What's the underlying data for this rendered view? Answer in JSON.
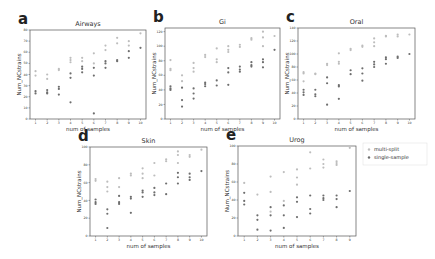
{
  "figure": {
    "legend": {
      "entries": [
        {
          "label": "multi-split",
          "color": "#bdbdbd"
        },
        {
          "label": "single-sample",
          "color": "#6e6e6e"
        }
      ]
    }
  },
  "chart_data": [
    {
      "letter": "a",
      "type": "scatter",
      "title": "Airways",
      "xlabel": "num of samples",
      "ylabel": "Num_NCstrains",
      "ylim": [
        0,
        80
      ],
      "yticks": [
        0,
        10,
        20,
        30,
        40,
        50,
        60,
        70,
        80
      ],
      "xticks": [
        1,
        2,
        3,
        4,
        5,
        6,
        7,
        8,
        9,
        10
      ],
      "frame": [
        30,
        30,
        146,
        119
      ],
      "series": [
        {
          "name": "multi-split",
          "points": [
            [
              1,
              43
            ],
            [
              1,
              39
            ],
            [
              2,
              40
            ],
            [
              2,
              36
            ],
            [
              3,
              45
            ],
            [
              3,
              44
            ],
            [
              4,
              55
            ],
            [
              4,
              53
            ],
            [
              4,
              51
            ],
            [
              5,
              55
            ],
            [
              5,
              52
            ],
            [
              6,
              59
            ],
            [
              6,
              50
            ],
            [
              7,
              66
            ],
            [
              7,
              62
            ],
            [
              8,
              73
            ],
            [
              8,
              68
            ],
            [
              9,
              70
            ],
            [
              9,
              66
            ],
            [
              10,
              77
            ]
          ]
        },
        {
          "name": "single-sample",
          "points": [
            [
              1,
              25
            ],
            [
              1,
              23
            ],
            [
              2,
              26
            ],
            [
              2,
              24
            ],
            [
              2,
              23
            ],
            [
              3,
              29
            ],
            [
              3,
              27
            ],
            [
              3,
              22
            ],
            [
              4,
              41
            ],
            [
              4,
              37
            ],
            [
              4,
              15
            ],
            [
              5,
              47
            ],
            [
              5,
              45
            ],
            [
              5,
              42
            ],
            [
              6,
              46
            ],
            [
              6,
              39
            ],
            [
              6,
              5
            ],
            [
              7,
              52
            ],
            [
              7,
              50
            ],
            [
              7,
              46
            ],
            [
              8,
              53
            ],
            [
              8,
              52
            ],
            [
              9,
              61
            ],
            [
              9,
              55
            ],
            [
              10,
              64
            ]
          ]
        }
      ]
    },
    {
      "letter": "b",
      "type": "scatter",
      "title": "Gi",
      "xlabel": "num of samples",
      "ylabel": "Num_NCstrains",
      "ylim": [
        0,
        125
      ],
      "yticks": [
        0,
        20,
        40,
        60,
        80,
        100,
        120
      ],
      "xticks": [
        1,
        2,
        3,
        4,
        5,
        6,
        7,
        8,
        9,
        10
      ],
      "frame": [
        165,
        28,
        280,
        119
      ],
      "series": [
        {
          "name": "multi-split",
          "points": [
            [
              1,
              81
            ],
            [
              1,
              69
            ],
            [
              1,
              67
            ],
            [
              2,
              60
            ],
            [
              2,
              52
            ],
            [
              3,
              77
            ],
            [
              3,
              70
            ],
            [
              3,
              65
            ],
            [
              4,
              88
            ],
            [
              4,
              85
            ],
            [
              5,
              97
            ],
            [
              5,
              82
            ],
            [
              5,
              78
            ],
            [
              6,
              100
            ],
            [
              6,
              95
            ],
            [
              6,
              92
            ],
            [
              7,
              102
            ],
            [
              7,
              99
            ],
            [
              8,
              111
            ],
            [
              8,
              109
            ],
            [
              9,
              120
            ],
            [
              9,
              112
            ],
            [
              9,
              100
            ],
            [
              10,
              114
            ]
          ]
        },
        {
          "name": "single-sample",
          "points": [
            [
              1,
              45
            ],
            [
              1,
              42
            ],
            [
              1,
              40
            ],
            [
              2,
              43
            ],
            [
              2,
              26
            ],
            [
              2,
              17
            ],
            [
              3,
              42
            ],
            [
              3,
              35
            ],
            [
              3,
              28
            ],
            [
              4,
              50
            ],
            [
              4,
              48
            ],
            [
              4,
              45
            ],
            [
              5,
              53
            ],
            [
              5,
              46
            ],
            [
              6,
              70
            ],
            [
              6,
              64
            ],
            [
              6,
              47
            ],
            [
              7,
              72
            ],
            [
              7,
              68
            ],
            [
              7,
              65
            ],
            [
              8,
              78
            ],
            [
              8,
              74
            ],
            [
              8,
              72
            ],
            [
              9,
              82
            ],
            [
              9,
              78
            ],
            [
              9,
              71
            ],
            [
              10,
              95
            ]
          ]
        }
      ]
    },
    {
      "letter": "c",
      "type": "scatter",
      "title": "Oral",
      "xlabel": "num of samples",
      "ylabel": "Num_NCstrains",
      "ylim": [
        0,
        140
      ],
      "yticks": [
        0,
        20,
        40,
        60,
        80,
        100,
        120,
        140
      ],
      "xticks": [
        1,
        2,
        3,
        4,
        5,
        6,
        7,
        8,
        9,
        10
      ],
      "frame": [
        298,
        28,
        415,
        119
      ],
      "series": [
        {
          "name": "multi-split",
          "points": [
            [
              1,
              72
            ],
            [
              1,
              70
            ],
            [
              1,
              58
            ],
            [
              2,
              70
            ],
            [
              2,
              69
            ],
            [
              3,
              85
            ],
            [
              3,
              83
            ],
            [
              4,
              101
            ],
            [
              4,
              88
            ],
            [
              4,
              85
            ],
            [
              5,
              108
            ],
            [
              5,
              106
            ],
            [
              6,
              113
            ],
            [
              6,
              111
            ],
            [
              7,
              124
            ],
            [
              7,
              118
            ],
            [
              7,
              112
            ],
            [
              8,
              128
            ],
            [
              8,
              127
            ],
            [
              9,
              130
            ],
            [
              9,
              127
            ],
            [
              10,
              130
            ]
          ]
        },
        {
          "name": "single-sample",
          "points": [
            [
              1,
              45
            ],
            [
              1,
              41
            ],
            [
              1,
              37
            ],
            [
              2,
              45
            ],
            [
              2,
              38
            ],
            [
              2,
              35
            ],
            [
              3,
              64
            ],
            [
              3,
              55
            ],
            [
              3,
              22
            ],
            [
              4,
              52
            ],
            [
              4,
              50
            ],
            [
              4,
              31
            ],
            [
              5,
              75
            ],
            [
              5,
              69
            ],
            [
              6,
              78
            ],
            [
              6,
              70
            ],
            [
              6,
              59
            ],
            [
              7,
              88
            ],
            [
              7,
              84
            ],
            [
              7,
              80
            ],
            [
              8,
              95
            ],
            [
              8,
              92
            ],
            [
              8,
              85
            ],
            [
              9,
              96
            ],
            [
              9,
              94
            ],
            [
              10,
              100
            ]
          ]
        }
      ]
    },
    {
      "letter": "d",
      "type": "scatter",
      "title": "Skin",
      "xlabel": "num of samples",
      "ylabel": "Num_NCstrains",
      "ylim": [
        0,
        100
      ],
      "yticks": [
        0,
        20,
        40,
        60,
        80,
        100
      ],
      "xticks": [
        1,
        2,
        3,
        4,
        5,
        6,
        7,
        8,
        9,
        10
      ],
      "frame": [
        90,
        147,
        207,
        236
      ],
      "series": [
        {
          "name": "multi-split",
          "points": [
            [
              1,
              64
            ],
            [
              1,
              62
            ],
            [
              2,
              61
            ],
            [
              2,
              55
            ],
            [
              2,
              50
            ],
            [
              3,
              65
            ],
            [
              3,
              55
            ],
            [
              4,
              70
            ],
            [
              4,
              68
            ],
            [
              5,
              76
            ],
            [
              5,
              70
            ],
            [
              5,
              65
            ],
            [
              6,
              82
            ],
            [
              6,
              68
            ],
            [
              7,
              86
            ],
            [
              7,
              84
            ],
            [
              8,
              95
            ],
            [
              8,
              91
            ],
            [
              8,
              82
            ],
            [
              9,
              91
            ],
            [
              9,
              89
            ],
            [
              10,
              97
            ]
          ]
        },
        {
          "name": "single-sample",
          "points": [
            [
              1,
              41
            ],
            [
              1,
              38
            ],
            [
              1,
              36
            ],
            [
              2,
              30
            ],
            [
              2,
              25
            ],
            [
              2,
              9
            ],
            [
              3,
              45
            ],
            [
              3,
              38
            ],
            [
              3,
              36
            ],
            [
              4,
              44
            ],
            [
              4,
              42
            ],
            [
              4,
              26
            ],
            [
              5,
              51
            ],
            [
              5,
              49
            ],
            [
              5,
              44
            ],
            [
              6,
              54
            ],
            [
              6,
              49
            ],
            [
              6,
              46
            ],
            [
              7,
              59
            ],
            [
              7,
              47
            ],
            [
              8,
              71
            ],
            [
              8,
              66
            ],
            [
              8,
              59
            ],
            [
              9,
              70
            ],
            [
              9,
              66
            ],
            [
              9,
              63
            ],
            [
              10,
              73
            ]
          ]
        }
      ]
    },
    {
      "letter": "e",
      "type": "scatter",
      "title": "Urog",
      "xlabel": "num of samples",
      "ylabel": "Num_NCstrains",
      "ylim": [
        0,
        100
      ],
      "yticks": [
        0,
        20,
        40,
        60,
        80,
        100
      ],
      "xticks": [
        1,
        2,
        3,
        4,
        5,
        6,
        7,
        8,
        9
      ],
      "frame": [
        238,
        146,
        356,
        236
      ],
      "series": [
        {
          "name": "multi-split",
          "points": [
            [
              1,
              59
            ],
            [
              2,
              46
            ],
            [
              3,
              66
            ],
            [
              3,
              49
            ],
            [
              3,
              27
            ],
            [
              4,
              71
            ],
            [
              4,
              39
            ],
            [
              5,
              74
            ],
            [
              5,
              65
            ],
            [
              5,
              57
            ],
            [
              6,
              75
            ],
            [
              6,
              93
            ],
            [
              7,
              85
            ],
            [
              7,
              80
            ],
            [
              7,
              76
            ],
            [
              8,
              83
            ],
            [
              8,
              81
            ],
            [
              8,
              79
            ],
            [
              9,
              98
            ]
          ]
        },
        {
          "name": "single-sample",
          "points": [
            [
              1,
              48
            ],
            [
              1,
              39
            ],
            [
              1,
              35
            ],
            [
              2,
              23
            ],
            [
              2,
              18
            ],
            [
              2,
              7
            ],
            [
              3,
              32
            ],
            [
              3,
              23
            ],
            [
              3,
              6
            ],
            [
              4,
              34
            ],
            [
              4,
              23
            ],
            [
              4,
              9
            ],
            [
              5,
              43
            ],
            [
              5,
              38
            ],
            [
              5,
              21
            ],
            [
              6,
              45
            ],
            [
              6,
              30
            ],
            [
              6,
              25
            ],
            [
              7,
              45
            ],
            [
              7,
              42
            ],
            [
              7,
              40
            ],
            [
              8,
              45
            ],
            [
              8,
              41
            ],
            [
              8,
              32
            ],
            [
              9,
              50
            ]
          ]
        }
      ]
    }
  ]
}
